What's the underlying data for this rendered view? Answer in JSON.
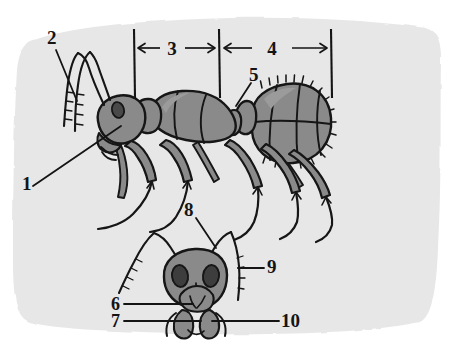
{
  "figure": {
    "background_color": "#ffffff",
    "paper_color": "#e7e7e7",
    "body_color": "#8a8a8a",
    "body_shadow_color": "#757575",
    "ink_color": "#141414",
    "eye_color": "#3d3d3d"
  },
  "labels": [
    {
      "id": "1",
      "text": "1",
      "x": 22,
      "y": 190,
      "anchor": "start"
    },
    {
      "id": "2",
      "text": "2",
      "x": 47,
      "y": 44,
      "anchor": "start"
    },
    {
      "id": "3",
      "text": "3",
      "x": 172,
      "y": 54,
      "anchor": "middle"
    },
    {
      "id": "4",
      "text": "4",
      "x": 272,
      "y": 54,
      "anchor": "middle"
    },
    {
      "id": "5",
      "text": "5",
      "x": 251,
      "y": 79,
      "anchor": "start"
    },
    {
      "id": "6",
      "text": "6",
      "x": 113,
      "y": 309,
      "anchor": "start"
    },
    {
      "id": "7",
      "text": "7",
      "x": 113,
      "y": 326,
      "anchor": "start"
    },
    {
      "id": "8",
      "text": "8",
      "x": 185,
      "y": 214,
      "anchor": "start"
    },
    {
      "id": "9",
      "text": "9",
      "x": 268,
      "y": 272,
      "anchor": "start"
    },
    {
      "id": "10",
      "text": "10",
      "x": 282,
      "y": 326,
      "anchor": "start"
    }
  ],
  "brackets": [
    {
      "id": "bracket-3",
      "label": "3",
      "left_tick_x": 134,
      "right_tick_x": 219,
      "y": 48
    },
    {
      "id": "bracket-4",
      "label": "4",
      "left_tick_x": 219,
      "right_tick_x": 331,
      "y": 48
    }
  ]
}
